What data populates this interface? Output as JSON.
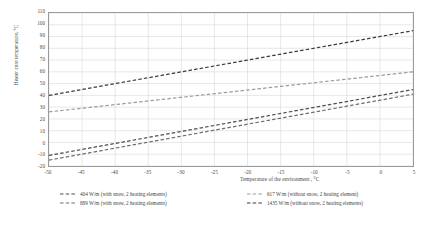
{
  "chart_data": {
    "type": "line",
    "title": "",
    "xlabel": "Temperature of the environment , °C",
    "ylabel": "Heater core temperature, °C",
    "xlim": [
      -50,
      5
    ],
    "ylim": [
      -20,
      110
    ],
    "xticks": [
      -50,
      -45,
      -40,
      -35,
      -30,
      -25,
      -20,
      -15,
      -10,
      -5,
      0,
      5
    ],
    "yticks": [
      -20,
      -10,
      0,
      10,
      20,
      30,
      40,
      50,
      60,
      70,
      80,
      90,
      100,
      110
    ],
    "grid": true,
    "legend_position": "bottom",
    "legend_columns": 2,
    "x": [
      -50,
      5
    ],
    "series": [
      {
        "name": "404 W/m (with snow, 2 heating elements)",
        "values": [
          -11,
          45
        ],
        "color": "#4d4d4d",
        "dash": "dashed",
        "legend_column": 1,
        "legend_row": 1
      },
      {
        "name": "889 W/m (with snow, 2 heating elements)",
        "values": [
          -15,
          41
        ],
        "color": "#6e6e6e",
        "dash": "dashed",
        "legend_column": 1,
        "legend_row": 2
      },
      {
        "name": "617 W/m (without snow, 2 heating element)",
        "values": [
          26,
          60
        ],
        "color": "#9c9c9c",
        "dash": "dashed",
        "legend_column": 2,
        "legend_row": 1
      },
      {
        "name": "1435 W/m (without snow, 2 heating elements)",
        "values": [
          40,
          95
        ],
        "color": "#3a3a3a",
        "dash": "dashed",
        "legend_column": 2,
        "legend_row": 2
      }
    ]
  },
  "axis": {
    "x_tick_labels": [
      "-50",
      "-45",
      "-40",
      "-35",
      "-30",
      "-25",
      "-20",
      "-15",
      "-10",
      "-5",
      "0",
      "5"
    ],
    "y_tick_labels": [
      "110",
      "100",
      "90",
      "80",
      "70",
      "60",
      "50",
      "40",
      "30",
      "20",
      "10",
      "0",
      "-10",
      "-20"
    ]
  },
  "colors": {
    "grid": "#d0d0d0",
    "frame": "#9a9a9a",
    "text": "#4a4a4a",
    "background": "#ffffff"
  }
}
